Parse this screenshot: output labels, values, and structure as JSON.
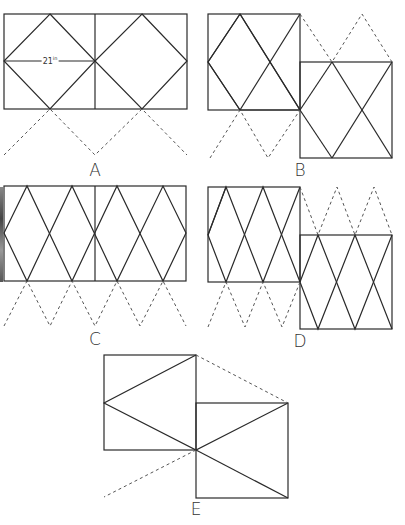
{
  "figures": [
    {
      "id": "A",
      "label": "A"
    },
    {
      "id": "B",
      "label": "B"
    },
    {
      "id": "C",
      "label": "C"
    },
    {
      "id": "D",
      "label": "D"
    },
    {
      "id": "E",
      "label": "E"
    }
  ],
  "dimension": {
    "value": "21",
    "unit": "in"
  }
}
